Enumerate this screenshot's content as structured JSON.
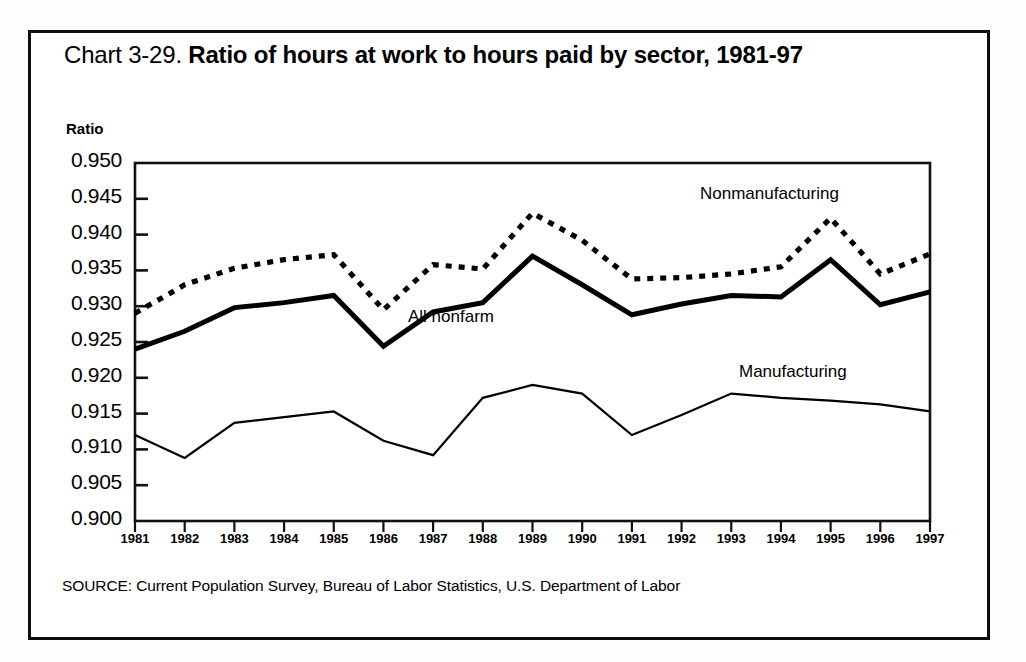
{
  "document": {
    "title_prefix": "Chart 3-29. ",
    "title_main": "Ratio of hours at work to hours paid by sector, 1981-97",
    "source": "SOURCE: Current Population Survey, Bureau of Labor Statistics, U.S. Department of Labor"
  },
  "chart_data": {
    "type": "line",
    "title": "Chart 3-29. Ratio of hours at work to hours paid by sector, 1981-97",
    "xlabel": "",
    "ylabel": "Ratio",
    "ylim": [
      0.9,
      0.95
    ],
    "ytick_step": 0.005,
    "grid": false,
    "legend": "inline-annotations",
    "categories": [
      1981,
      1982,
      1983,
      1984,
      1985,
      1986,
      1987,
      1988,
      1989,
      1990,
      1991,
      1992,
      1993,
      1994,
      1995,
      1996,
      1997
    ],
    "x": [
      "1981",
      "1982",
      "1983",
      "1984",
      "1985",
      "1986",
      "1987",
      "1988",
      "1989",
      "1990",
      "1991",
      "1992",
      "1993",
      "1994",
      "1995",
      "1996",
      "1997"
    ],
    "yticks": [
      "0.900",
      "0.905",
      "0.910",
      "0.915",
      "0.920",
      "0.925",
      "0.930",
      "0.935",
      "0.940",
      "0.945",
      "0.950"
    ],
    "series": [
      {
        "name": "Nonmanufacturing",
        "style": "dotted",
        "color": "#000000",
        "label_position": "upper-right",
        "values": [
          0.929,
          0.933,
          0.9353,
          0.9365,
          0.9372,
          0.9295,
          0.9358,
          0.9352,
          0.943,
          0.9392,
          0.9338,
          0.934,
          0.9345,
          0.9355,
          0.9423,
          0.9345,
          0.9373
        ]
      },
      {
        "name": "All nonfarm",
        "style": "solid-thick",
        "color": "#000000",
        "label_position": "center",
        "values": [
          0.924,
          0.9265,
          0.9298,
          0.9305,
          0.9315,
          0.9244,
          0.9292,
          0.9305,
          0.937,
          0.933,
          0.9288,
          0.9303,
          0.9315,
          0.9313,
          0.9365,
          0.9302,
          0.932
        ]
      },
      {
        "name": "Manufacturing",
        "style": "solid-thin",
        "color": "#000000",
        "label_position": "right",
        "values": [
          0.912,
          0.9088,
          0.9137,
          0.9145,
          0.9153,
          0.9112,
          0.9092,
          0.9172,
          0.919,
          0.9178,
          0.912,
          0.9148,
          0.9178,
          0.9172,
          0.9168,
          0.9163,
          0.9153
        ]
      }
    ]
  },
  "axis": {
    "y_caption": "Ratio",
    "y_labels": [
      "0.950",
      "0.945",
      "0.940",
      "0.935",
      "0.930",
      "0.925",
      "0.920",
      "0.915",
      "0.910",
      "0.905",
      "0.900"
    ],
    "x_labels": [
      "1981",
      "1982",
      "1983",
      "1984",
      "1985",
      "1986",
      "1987",
      "1988",
      "1989",
      "1990",
      "1991",
      "1992",
      "1993",
      "1994",
      "1995",
      "1996",
      "1997"
    ]
  },
  "annotations": {
    "nonmanufacturing": "Nonmanufacturing",
    "all_nonfarm": "All nonfarm",
    "manufacturing": "Manufacturing"
  }
}
